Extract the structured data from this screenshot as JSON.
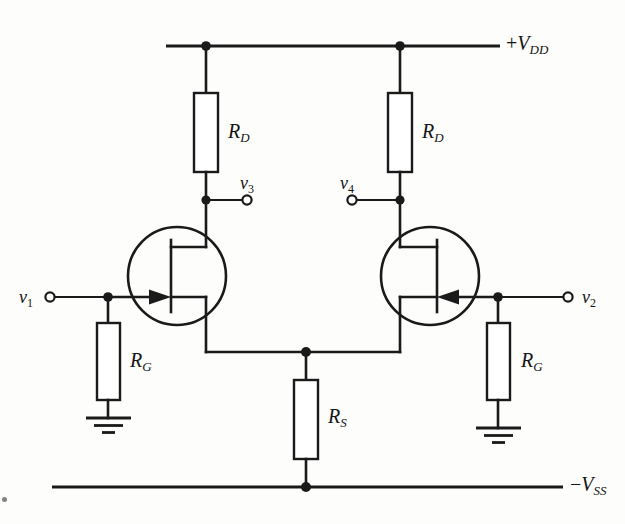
{
  "figure": {
    "kind": "circuit-schematic",
    "background_color": "#fdfdfc",
    "ink_color": "#1a1a1a"
  },
  "rails": {
    "top": {
      "name": "positive-supply-rail",
      "label_sign": "+",
      "label_symbol": "V",
      "label_subscript": "DD",
      "label_text": "+V DD"
    },
    "bottom": {
      "name": "negative-supply-rail",
      "label_sign": "−",
      "label_symbol": "V",
      "label_subscript": "SS",
      "label_text": "−V SS"
    }
  },
  "components": {
    "drain_resistor_left": {
      "symbol": "R",
      "subscript": "D"
    },
    "drain_resistor_right": {
      "symbol": "R",
      "subscript": "D"
    },
    "gate_resistor_left": {
      "symbol": "R",
      "subscript": "G"
    },
    "gate_resistor_right": {
      "symbol": "R",
      "subscript": "G"
    },
    "source_resistor": {
      "symbol": "R",
      "subscript": "S"
    },
    "jfet_left": {
      "type": "n-channel-jfet",
      "gate": "left"
    },
    "jfet_right": {
      "type": "n-channel-jfet",
      "gate": "right"
    }
  },
  "terminals": {
    "v1": {
      "symbol": "v",
      "subscript": "1",
      "role": "input-left"
    },
    "v2": {
      "symbol": "v",
      "subscript": "2",
      "role": "input-right"
    },
    "v3": {
      "symbol": "v",
      "subscript": "3",
      "role": "output-left"
    },
    "v4": {
      "symbol": "v",
      "subscript": "4",
      "role": "output-right"
    }
  },
  "grounds": {
    "left": {
      "name": "ground-left"
    },
    "right": {
      "name": "ground-right"
    }
  }
}
